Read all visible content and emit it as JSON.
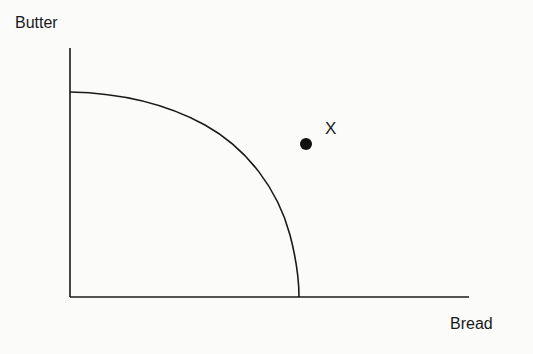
{
  "diagram": {
    "title": "",
    "type": "production-possibilities-frontier",
    "y_axis_label": "Butter",
    "x_axis_label": "Bread",
    "curve": {
      "shape": "concave quarter arc",
      "y_intercept_px": [
        70,
        92
      ],
      "x_intercept_px": [
        299,
        297
      ]
    },
    "point": {
      "label": "X",
      "position": "outside the frontier (unattainable)",
      "px": [
        306,
        144
      ]
    },
    "colors": {
      "ink": "#1a1a1a",
      "background": "#fbfbfa"
    }
  }
}
